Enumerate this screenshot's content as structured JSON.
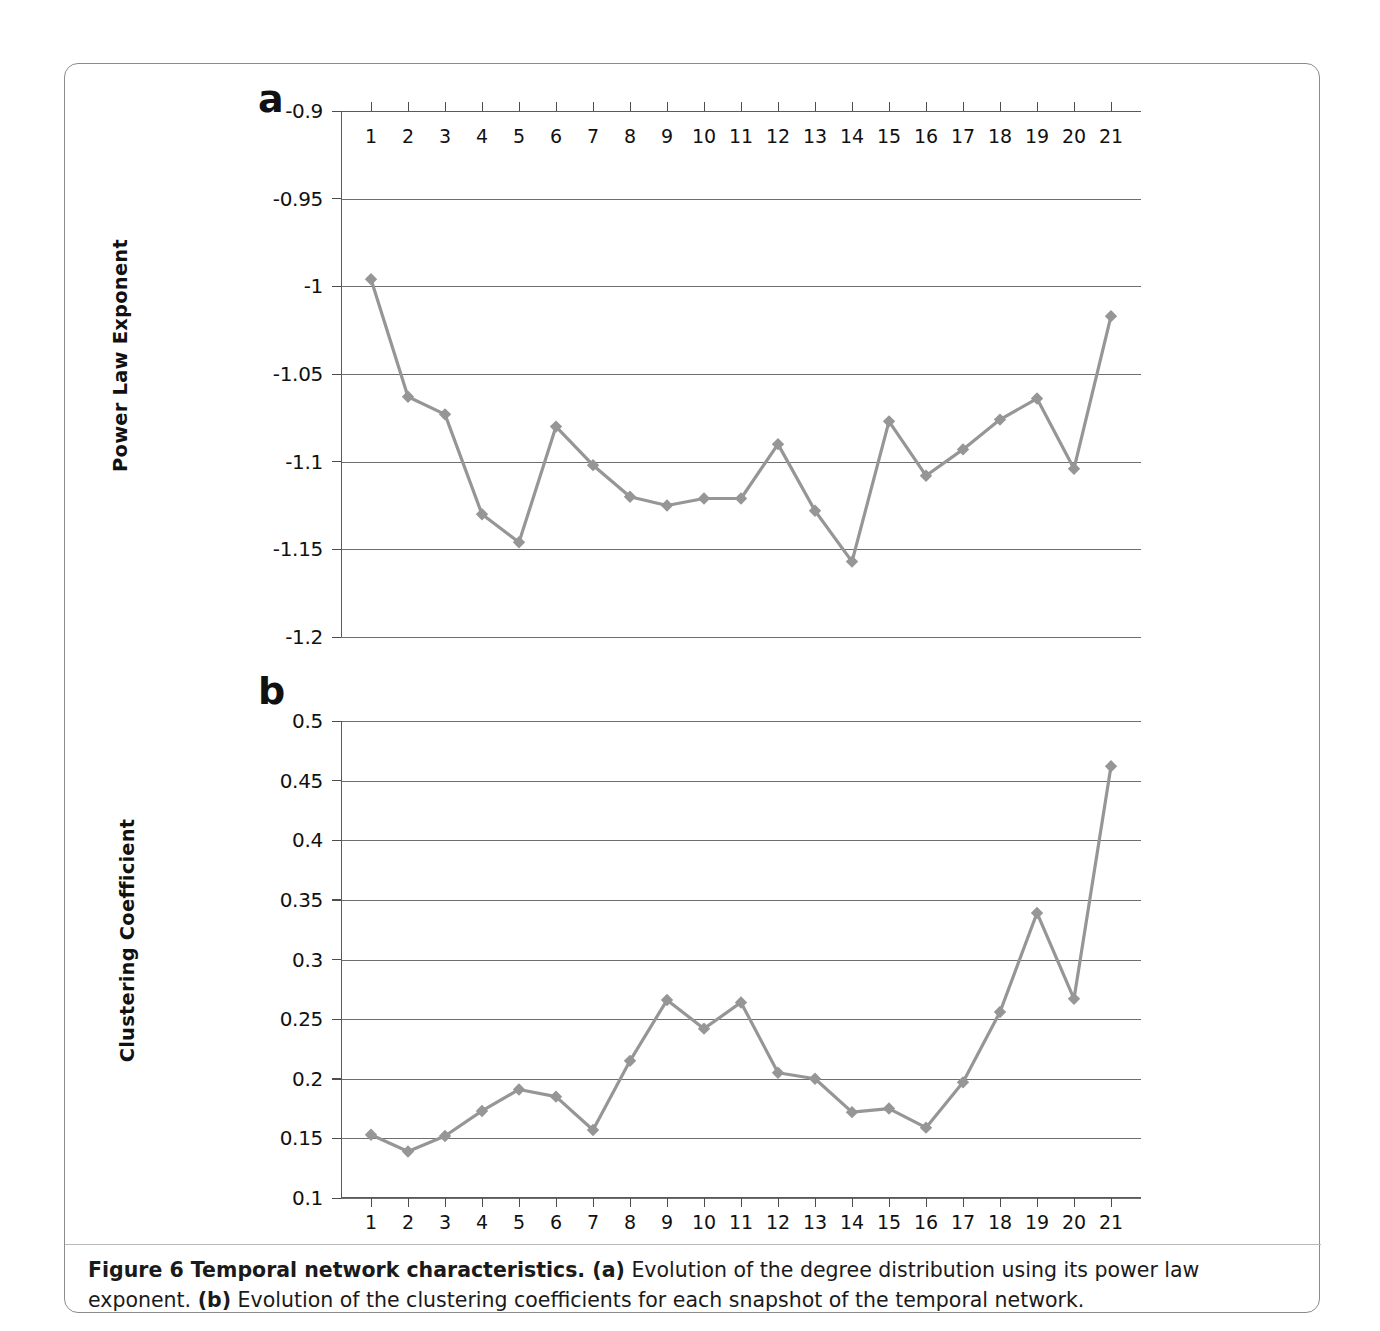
{
  "caption": {
    "figure_label": "Figure 6",
    "title": "Temporal network characteristics.",
    "part_a_marker": "(a)",
    "part_a_text": "Evolution of the degree distribution using its power law exponent.",
    "part_b_marker": "(b)",
    "part_b_text": "Evolution of the clustering coefficients for each snapshot of the temporal network."
  },
  "style": {
    "series_color": "#969696",
    "gridline_color": "#6e6e6e",
    "axis_color": "#5a5a5a",
    "text_color": "#111111"
  },
  "panels": {
    "a": {
      "letter": "a"
    },
    "b": {
      "letter": "b"
    }
  },
  "chart_data": [
    {
      "type": "line",
      "panel": "a",
      "title": "",
      "xlabel": "",
      "ylabel": "Power Law Exponent",
      "xlim": [
        1,
        21
      ],
      "ylim": [
        -1.2,
        -0.9
      ],
      "grid": true,
      "legend": "none",
      "marker": "diamond",
      "x_tick_position": "top",
      "categories": [
        1,
        2,
        3,
        4,
        5,
        6,
        7,
        8,
        9,
        10,
        11,
        12,
        13,
        14,
        15,
        16,
        17,
        18,
        19,
        20,
        21
      ],
      "xticklabels": [
        "1",
        "2",
        "3",
        "4",
        "5",
        "6",
        "7",
        "8",
        "9",
        "10",
        "11",
        "12",
        "13",
        "14",
        "15",
        "16",
        "17",
        "18",
        "19",
        "20",
        "21"
      ],
      "yticklabels": [
        "-0.9",
        "-0.95",
        "-1",
        "-1.05",
        "-1.1",
        "-1.15",
        "-1.2"
      ],
      "yticks": [
        -0.9,
        -0.95,
        -1,
        -1.05,
        -1.1,
        -1.15,
        -1.2
      ],
      "values": [
        -0.996,
        -1.063,
        -1.073,
        -1.13,
        -1.146,
        -1.08,
        -1.102,
        -1.12,
        -1.125,
        -1.121,
        -1.121,
        -1.09,
        -1.128,
        -1.157,
        -1.077,
        -1.108,
        -1.093,
        -1.076,
        -1.064,
        -1.104,
        -1.017
      ]
    },
    {
      "type": "line",
      "panel": "b",
      "title": "",
      "xlabel": "",
      "ylabel": "Clustering Coefficient",
      "xlim": [
        1,
        21
      ],
      "ylim": [
        0.1,
        0.5
      ],
      "grid": true,
      "legend": "none",
      "marker": "diamond",
      "x_tick_position": "bottom",
      "categories": [
        1,
        2,
        3,
        4,
        5,
        6,
        7,
        8,
        9,
        10,
        11,
        12,
        13,
        14,
        15,
        16,
        17,
        18,
        19,
        20,
        21
      ],
      "xticklabels": [
        "1",
        "2",
        "3",
        "4",
        "5",
        "6",
        "7",
        "8",
        "9",
        "10",
        "11",
        "12",
        "13",
        "14",
        "15",
        "16",
        "17",
        "18",
        "19",
        "20",
        "21"
      ],
      "yticklabels": [
        "0.5",
        "0.45",
        "0.4",
        "0.35",
        "0.3",
        "0.25",
        "0.2",
        "0.15",
        "0.1"
      ],
      "yticks": [
        0.5,
        0.45,
        0.4,
        0.35,
        0.3,
        0.25,
        0.2,
        0.15,
        0.1
      ],
      "values": [
        0.153,
        0.139,
        0.152,
        0.173,
        0.191,
        0.185,
        0.157,
        0.215,
        0.266,
        0.242,
        0.264,
        0.205,
        0.2,
        0.172,
        0.175,
        0.159,
        0.197,
        0.256,
        0.339,
        0.267,
        0.462
      ]
    }
  ]
}
